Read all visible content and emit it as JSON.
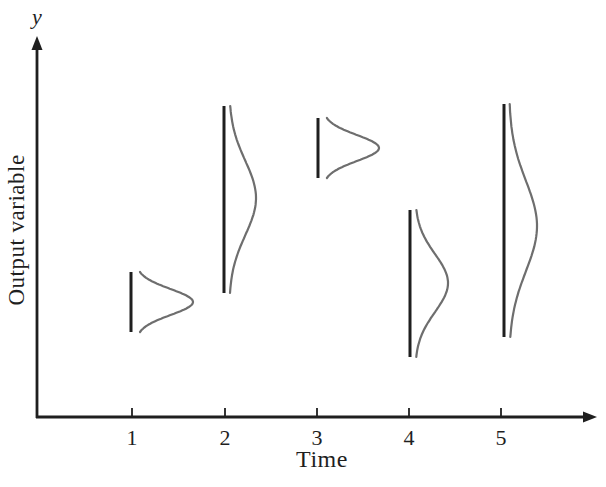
{
  "figure": {
    "y_axis_symbol": "y",
    "y_axis_title": "Output variable",
    "x_axis_title": "Time"
  },
  "colors": {
    "background": "#ffffff",
    "axis": "#1f1f1f",
    "curve": "#6e6e6e",
    "text": "#1f1f1f"
  },
  "chart_data": {
    "type": "line",
    "title": "",
    "xlabel": "Time",
    "ylabel": "Output variable",
    "x_ticks": [
      "1",
      "2",
      "3",
      "4",
      "5"
    ],
    "y_ticks": [],
    "geometry": {
      "origin_x": 37,
      "axis_y": 417,
      "y_arrow_tip_y": 36,
      "x_arrow_tip_x": 597,
      "tick_xs": [
        132,
        225,
        317,
        409,
        501
      ],
      "tick_len": 9,
      "tick_label_y": 425,
      "axis_width": 2.8,
      "bar_width": 3,
      "curve_gap": 5,
      "curve_width": 2.2
    },
    "distributions": [
      {
        "time": 1,
        "bar_x": 131,
        "bar_top_y": 272,
        "bar_bottom_y": 332,
        "amplitude": 57,
        "peak_y": 302,
        "sigma": 13
      },
      {
        "time": 2,
        "bar_x": 224,
        "bar_top_y": 106,
        "bar_bottom_y": 293,
        "amplitude": 27,
        "peak_y": 198,
        "sigma": 37
      },
      {
        "time": 3,
        "bar_x": 318,
        "bar_top_y": 118,
        "bar_bottom_y": 178,
        "amplitude": 56,
        "peak_y": 148,
        "sigma": 13
      },
      {
        "time": 4,
        "bar_x": 410,
        "bar_top_y": 210,
        "bar_bottom_y": 357,
        "amplitude": 33,
        "peak_y": 283,
        "sigma": 29
      },
      {
        "time": 5,
        "bar_x": 504,
        "bar_top_y": 104,
        "bar_bottom_y": 337,
        "amplitude": 28,
        "peak_y": 226,
        "sigma": 45
      }
    ]
  }
}
